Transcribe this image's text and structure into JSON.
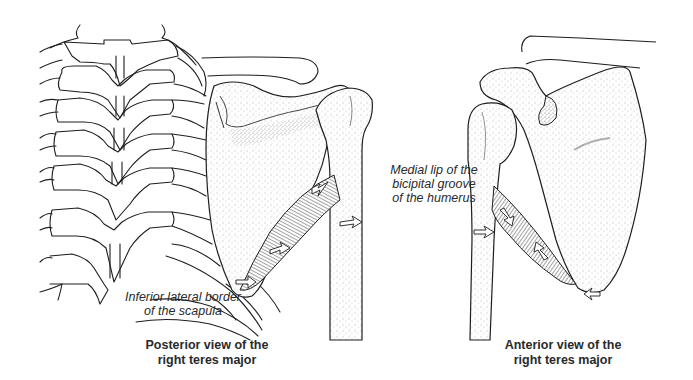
{
  "figure": {
    "panels": [
      {
        "id": "posterior",
        "caption_lines": [
          "Posterior view of the",
          "right teres major"
        ],
        "structures": [
          "thoracic spine",
          "ribs",
          "clavicle",
          "scapula",
          "humerus",
          "teres major muscle"
        ]
      },
      {
        "id": "anterior",
        "caption_lines": [
          "Anterior view of the",
          "right teres major"
        ],
        "structures": [
          "clavicle",
          "coracoid process",
          "scapula",
          "humerus",
          "teres major muscle"
        ]
      }
    ],
    "annotations": {
      "medial_lip": [
        "Medial lip of the",
        "bicipital groove",
        "of the humerus"
      ],
      "inferior_border": [
        "Inferior lateral border",
        "of the scapula"
      ]
    },
    "colors": {
      "ink": "#1e1e1e",
      "stipple": "#555555",
      "muscle": "#3a3a3a",
      "background": "#ffffff"
    }
  }
}
